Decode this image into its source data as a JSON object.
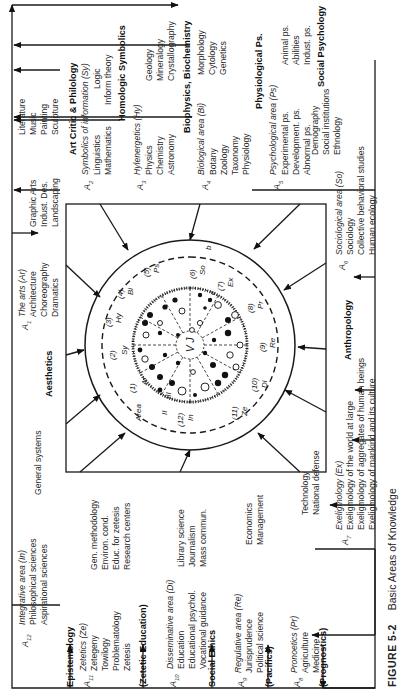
{
  "caption": {
    "figure": "FIGURE 5-2",
    "title": "Basic Areas of Knowledge"
  },
  "center": {
    "ring_labels": [
      "II",
      "III"
    ],
    "area_word": "Area",
    "core": "V J",
    "sectors": [
      {
        "num": "(1)",
        "abbr": "Ar"
      },
      {
        "num": "(2)",
        "abbr": "Sy"
      },
      {
        "num": "(3)",
        "abbr": "Hy"
      },
      {
        "num": "(4)",
        "abbr": "Bi"
      },
      {
        "num": "(5)",
        "abbr": "Ps"
      },
      {
        "num": "(6)",
        "abbr": "So"
      },
      {
        "num": "(7)",
        "abbr": "Ex"
      },
      {
        "num": "(8)",
        "abbr": "Pr"
      },
      {
        "num": "(9)",
        "abbr": "Re"
      },
      {
        "num": "(10)",
        "abbr": "Di"
      },
      {
        "num": "(11)",
        "abbr": "Ze"
      },
      {
        "num": "(12)",
        "abbr": "In"
      }
    ],
    "marks": [
      "c",
      "b"
    ]
  },
  "connectors": {
    "aesthetics": "Aesthetics",
    "art_critic": "Art Critic & Philology",
    "homologic": "Homologic Symbolics",
    "biophysics": "Biophysics, Biochemistry",
    "physiological": "Physiological Ps.",
    "social_psych": "Social Psychology",
    "anthropology": "Anthropology",
    "prognostics": "(Prognostics)",
    "pacifics": "(Pacifics)",
    "social_ethics": "Social Ethics",
    "zetetic_education": "(Zetetic Education)",
    "epistemology": "Epistemology"
  },
  "areas": {
    "a1": {
      "label": "A",
      "sub": "1",
      "title": "The arts (Ar)",
      "col1": [
        "Architecture",
        "Choreography",
        "Dramatics"
      ],
      "col2": [
        "Graphic Arts",
        "Indust. Des.",
        "Landscaping"
      ],
      "col3": [
        "Literature",
        "Music",
        "Painting",
        "Sculpture"
      ]
    },
    "a2": {
      "label": "A",
      "sub": "2",
      "title": "Symbolics of information (Sy)",
      "col1": [
        "Linguistics",
        "Mathematics"
      ],
      "col2": [
        "Logic",
        "Inform theory"
      ]
    },
    "a3": {
      "label": "A",
      "sub": "3",
      "title": "Hylenergetics (Hy)",
      "col1": [
        "Physics",
        "Chemistry",
        "Astronomy"
      ],
      "col2": [
        "Geology",
        "Mineralogy",
        "Crystallography"
      ]
    },
    "a4": {
      "label": "A",
      "sub": "4",
      "title": "Biological area (Bi)",
      "col1": [
        "Botany",
        "Zoology",
        "Taxonomy",
        "Physiology"
      ],
      "col2": [
        "Morphology",
        "Cytology",
        "Genetics"
      ]
    },
    "a5": {
      "label": "A",
      "sub": "5",
      "title": "Psychological area (Ps)",
      "col1": [
        "Experimental ps.",
        "Development. ps.",
        "Abnormal ps."
      ],
      "col2": [
        "Animal ps.",
        "Abilities",
        "Indust. ps."
      ]
    },
    "a6": {
      "label": "A",
      "sub": "6",
      "title": "Sociological area (So)",
      "col1": [
        "Sociology",
        "Collective behavioral studies",
        "Human ecology"
      ],
      "col2": [
        "Demography",
        "Social institutions",
        "Ethnology"
      ]
    },
    "a7": {
      "label": "A",
      "sub": "7",
      "title": "Exeligmology (Ex)",
      "col1": [
        "Exeligmology of the world at large",
        "Exeligmology of aggregates of human beings",
        "Exeligmology of mankind and its culture"
      ]
    },
    "a8": {
      "label": "A",
      "sub": "8",
      "title": "Pronoetics (Pr)",
      "col1": [
        "Agriculture",
        "Medicine"
      ],
      "col2": [
        "Technology",
        "National defense"
      ]
    },
    "a9": {
      "label": "A",
      "sub": "9",
      "title": "Regulative area (Re)",
      "col1": [
        "Jurisprudence",
        "Political science"
      ],
      "col2": [
        "Economics",
        "Management"
      ]
    },
    "a10": {
      "label": "A",
      "sub": "10",
      "title": "Disseminative area (Di)",
      "col1": [
        "Education",
        "Educational psychol.",
        "Vocational guidance"
      ],
      "col2": [
        "Library science",
        "Journalism",
        "Mass commun."
      ]
    },
    "a11": {
      "label": "A",
      "sub": "11",
      "title": "Zetetics (Ze)",
      "col1": [
        "Zetegeny",
        "Towilogy",
        "Problematology",
        "Zetesis"
      ],
      "col2": [
        "Gen. methodology",
        "Environ. cond.",
        "Educ. for zetesis",
        "Research centers"
      ]
    },
    "a12": {
      "label": "A",
      "sub": "12",
      "title": "Integrative area (In)",
      "col1": [
        "Philosophical sciences",
        "Aspirational sciences"
      ],
      "col2": [
        "General systems"
      ]
    }
  }
}
